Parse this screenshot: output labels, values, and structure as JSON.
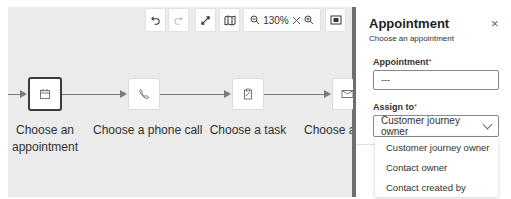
{
  "canvas": {
    "toolbar": {
      "undo": {
        "icon": "undo-icon"
      },
      "redo": {
        "icon": "redo-icon",
        "disabled": true
      },
      "expand": {
        "icon": "expand-icon"
      },
      "minimap": {
        "icon": "map-icon"
      },
      "zoom": {
        "zoom_out_icon": "zoom-out-icon",
        "level": "130%",
        "reset_icon": "close-icon",
        "zoom_in_icon": "zoom-in-icon"
      },
      "fit": {
        "icon": "fit-to-screen-icon"
      }
    },
    "nodes": [
      {
        "label_line1": "Choose an",
        "label_line2": "appointment",
        "icon": "calendar-icon",
        "selected": true
      },
      {
        "label_line1": "Choose a phone call",
        "icon": "phone-icon",
        "selected": false
      },
      {
        "label_line1": "Choose a task",
        "icon": "clipboard-icon",
        "selected": false
      },
      {
        "label_line1": "Choose a",
        "icon": "envelope-icon",
        "selected": false
      }
    ]
  },
  "panel": {
    "title": "Appointment",
    "subtitle": "Choose an appointment",
    "close_label": "×",
    "appointment_field": {
      "label": "Appointment",
      "required_mark": "*",
      "value": "---"
    },
    "assign_field": {
      "label": "Assign to",
      "required_mark": "*",
      "selected": "Customer journey owner",
      "options": [
        "Customer journey owner",
        "Contact owner",
        "Contact created by"
      ]
    }
  },
  "colors": {
    "canvas_bg": "#ebebeb",
    "divider": "#6f6f6f",
    "connector": "#7a7a7a",
    "required": "#a4262c"
  }
}
